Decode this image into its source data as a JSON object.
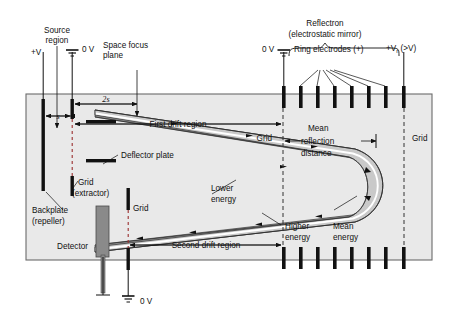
{
  "figure": {
    "colors": {
      "chamber_fill": "#e9e9e9",
      "chamber_border": "#6b6b6b",
      "electrode": "#111111",
      "detector": "#8a8a8a",
      "band_low_energy": "#c9c9c9",
      "band_high_energy": "#8e8e8e",
      "mean_line": "#ffffff",
      "background": "#ffffff"
    }
  },
  "labels": {
    "source_region": "Source\nregion",
    "source_region_l1": "Source",
    "source_region_l2": "region",
    "plus_v": "+V",
    "zero_v_left": "0 V",
    "zero_v_right": "0 V",
    "zero_v_bottom": "0 V",
    "space_focus_l1": "Space focus",
    "space_focus_l2": "plane",
    "reflectron_l1": "Reflectron",
    "reflectron_l2": "(electrostatic mirror)",
    "ring_electrodes": "Ring electrodes (+)",
    "reflectron_voltage_main": "+V",
    "reflectron_voltage_sub": "r",
    "reflectron_voltage_tail": " (>V)",
    "dim_2s": "2s",
    "dim_s": "s",
    "first_drift_region": "First drift region",
    "second_drift_region": "Second drift region",
    "grid_top": "Grid",
    "grid_right": "Grid",
    "grid_extractor_l1": "Grid",
    "grid_extractor_l2": "(extractor)",
    "grid_detector": "Grid",
    "mean_reflection_l1": "Mean",
    "mean_reflection_l2": "reflection",
    "mean_reflection_l3": "distance",
    "deflector_plate": "Deflector plate",
    "backplate_l1": "Backplate",
    "backplate_l2": "(repeller)",
    "detector": "Detector",
    "lower_energy_l1": "Lower",
    "lower_energy_l2": "energy",
    "higher_energy_l1": "Higher",
    "higher_energy_l2": "energy",
    "mean_energy_l1": "Mean",
    "mean_energy_l2": "energy"
  },
  "components": {
    "ring_electrodes_top_count": 8,
    "ring_electrodes_bottom_count": 8,
    "ground_symbols": 3,
    "trajectory_direction_markers": 10
  }
}
